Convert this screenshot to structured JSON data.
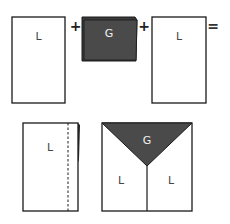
{
  "diagram": {
    "equation": {
      "panel_left": {
        "label": "L"
      },
      "op1": "+",
      "panel_middle": {
        "label": "G"
      },
      "op2": "+",
      "panel_right": {
        "label": "L"
      },
      "op3": "="
    },
    "result": {
      "folded_panel": {
        "label": "L"
      },
      "assembled": {
        "top_label": "G",
        "left_label": "L",
        "right_label": "L"
      }
    },
    "colors": {
      "dark_panel": "#4a4a4a",
      "outline": "#1a1a1a",
      "light_panel": "#ffffff",
      "dark_text": "#f0f0f0"
    }
  }
}
